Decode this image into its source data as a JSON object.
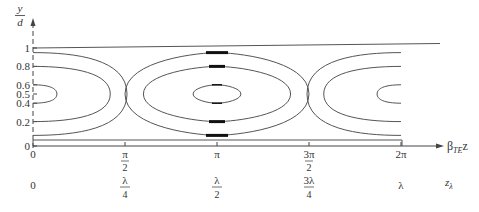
{
  "figure": {
    "y_axis": {
      "label_num": "y",
      "label_den": "d",
      "ticks": [
        {
          "value": 0,
          "label": "0"
        },
        {
          "value": 0.2,
          "label": "0.2"
        },
        {
          "value": 0.4,
          "label": "0.4"
        },
        {
          "value": 0.5,
          "label": "0.5"
        },
        {
          "value": 0.6,
          "label": "0.6"
        },
        {
          "value": 0.8,
          "label": "0.8"
        },
        {
          "value": 1,
          "label": "1"
        }
      ]
    },
    "x_axis": {
      "label_main": "β",
      "label_sub": "TE",
      "label_tail": "z",
      "ticks": [
        {
          "value": 0,
          "num": "0",
          "den": ""
        },
        {
          "value": 0.5,
          "num": "π",
          "den": "2"
        },
        {
          "value": 1,
          "num": "π",
          "den": ""
        },
        {
          "value": 1.5,
          "num": "3π",
          "den": "2"
        },
        {
          "value": 2,
          "num": "2π",
          "den": ""
        }
      ]
    },
    "z_axis": {
      "label_main": "z",
      "label_sub": "λ",
      "ticks": [
        {
          "value": 0,
          "num": "0",
          "den": ""
        },
        {
          "value": 0.5,
          "num": "λ",
          "den": "4"
        },
        {
          "value": 1,
          "num": "λ",
          "den": "2"
        },
        {
          "value": 1.5,
          "num": "3λ",
          "den": "4"
        },
        {
          "value": 2,
          "num": "λ",
          "den": ""
        }
      ]
    },
    "contours": [
      {
        "level": "outer",
        "y_min": 0.05,
        "y_max": 0.95
      },
      {
        "level": "middle",
        "y_min": 0.2,
        "y_max": 0.8
      },
      {
        "level": "inner",
        "y_min": 0.4,
        "y_max": 0.6
      }
    ]
  }
}
